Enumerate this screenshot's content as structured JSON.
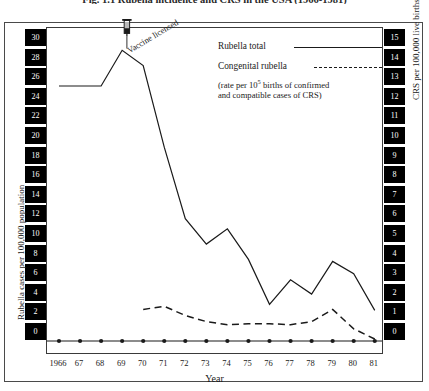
{
  "figure": {
    "title": "Fig. 1.1  Rubella incidence and CRS in the USA (1966-1981)"
  },
  "annotation": {
    "vaccine_label": "Vaccine licensed",
    "vaccine_icon": "syringe-icon",
    "vaccine_year": 1969
  },
  "legend": {
    "items": [
      {
        "label": "Rubella total",
        "style": "solid"
      },
      {
        "label": "Congenital rubella",
        "style": "dashed"
      }
    ],
    "note_line1_a": "(rate per 10",
    "note_line1_sup": "5",
    "note_line1_b": " births of confirmed",
    "note_line2": "and compatible cases of CRS)"
  },
  "axes": {
    "y_left_title": "Rubella cases per 100,000 population",
    "y_right_title": "CRS per 100,000 live births",
    "x_title": "Year",
    "y_left_ticks": [
      30,
      28,
      26,
      24,
      22,
      20,
      18,
      16,
      14,
      12,
      10,
      8,
      6,
      4,
      2,
      0
    ],
    "y_right_ticks": [
      15,
      14,
      13,
      12,
      11,
      10,
      9,
      8,
      7,
      6,
      5,
      4,
      3,
      2,
      1,
      0
    ],
    "x_ticks": [
      "1966",
      "67",
      "68",
      "69",
      "70",
      "71",
      "72",
      "73",
      "74",
      "75",
      "76",
      "77",
      "78",
      "79",
      "80",
      "81"
    ]
  },
  "chart_data": {
    "type": "line",
    "title": "Fig. 1.1  Rubella incidence and CRS in the USA (1966-1981)",
    "xlabel": "Year",
    "ylabel": "Rubella cases per 100,000 population",
    "y2label": "CRS per 100,000 live births",
    "x": [
      1966,
      1967,
      1968,
      1969,
      1970,
      1971,
      1972,
      1973,
      1974,
      1975,
      1976,
      1977,
      1978,
      1979,
      1980,
      1981
    ],
    "xlim": [
      1966,
      1981
    ],
    "ylim": [
      0,
      30
    ],
    "y2lim": [
      0,
      15
    ],
    "grid": false,
    "legend_position": "upper-right",
    "series": [
      {
        "name": "Rubella total",
        "style": "solid",
        "axis": "left",
        "color": "#1a1a1a",
        "values": [
          25.0,
          25.0,
          25.0,
          28.5,
          27.0,
          19.0,
          12.0,
          9.5,
          11.0,
          8.0,
          3.6,
          6.0,
          4.6,
          7.8,
          6.6,
          3.0
        ]
      },
      {
        "name": "Congenital rubella",
        "style": "dashed",
        "axis": "right",
        "color": "#1a1a1a",
        "values": [
          null,
          null,
          null,
          null,
          1.55,
          1.7,
          1.25,
          0.95,
          0.8,
          0.85,
          0.85,
          0.8,
          0.95,
          1.55,
          0.6,
          0.1
        ]
      }
    ]
  }
}
